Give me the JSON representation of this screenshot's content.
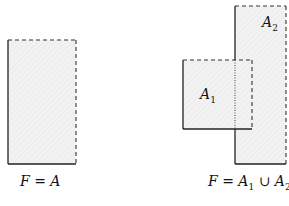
{
  "diagram": {
    "colors": {
      "fill": "#f0f0f0",
      "stroke": "#222222",
      "hatch": "#e2e2e2"
    },
    "left_panel": {
      "caption": {
        "lhs": "F",
        "eq": "=",
        "rhs": "A"
      },
      "shape": {
        "name": "A",
        "x": 8,
        "y": 40,
        "w": 68,
        "h": 124,
        "solid_edges": [
          "left",
          "bottom"
        ],
        "dashed_edges": [
          "top",
          "right"
        ]
      }
    },
    "right_panel": {
      "caption": {
        "lhs": "F",
        "eq": "=",
        "a1": "A",
        "a1_sub": "1",
        "union": "∪",
        "a2": "A",
        "a2_sub": "2"
      },
      "shapes": [
        {
          "name": "A1",
          "label": "A",
          "sub": "1",
          "x": 183,
          "y": 60,
          "w": 69,
          "h": 69,
          "solid_edges": [
            "left",
            "bottom"
          ],
          "dashed_edges": [
            "top",
            "right"
          ]
        },
        {
          "name": "A2",
          "label": "A",
          "sub": "2",
          "x": 235,
          "y": 6,
          "w": 51,
          "h": 158,
          "solid_edges": [
            "left",
            "bottom"
          ],
          "dashed_edges": [
            "top",
            "right"
          ]
        }
      ]
    }
  }
}
